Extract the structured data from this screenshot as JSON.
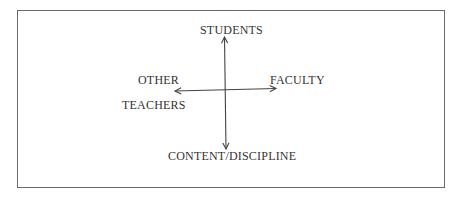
{
  "diagram": {
    "type": "four-direction arrow diagram",
    "nodes": {
      "top": "STUDENTS",
      "bottom": "CONTENT/DISCIPLINE",
      "left_top": "OTHER",
      "left_bottom": "TEACHERS",
      "right": "FACULTY"
    },
    "edges": [
      {
        "from": "center",
        "to": "STUDENTS",
        "direction": "up"
      },
      {
        "from": "center",
        "to": "CONTENT/DISCIPLINE",
        "direction": "down"
      },
      {
        "from": "center",
        "to": "OTHER TEACHERS",
        "direction": "left"
      },
      {
        "from": "center",
        "to": "FACULTY",
        "direction": "right"
      }
    ],
    "colors": {
      "border": "#6a6a6a",
      "text": "#333333",
      "arrow": "#444444"
    }
  }
}
